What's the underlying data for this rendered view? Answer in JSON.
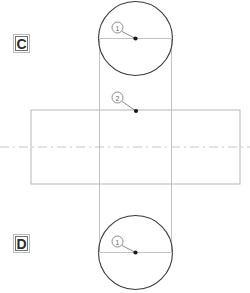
{
  "drawing": {
    "title": "Two-view orthographic part drawing",
    "background_color": "#ffffff",
    "width": 250,
    "height": 293,
    "line_colors": {
      "outline": "#3a3a3a",
      "projection": "#c3c3c3",
      "rectangle": "#b5b5b5",
      "centerline": "#bfc6cf",
      "balloon": "#8a8a8a",
      "leader": "#8a8a8a",
      "marker": "#1a1a1a",
      "tag_border": "#6f6f6f",
      "tag_text": "#2b2b2b"
    },
    "view_tags": [
      {
        "label": "C",
        "x": 13,
        "y": 34
      },
      {
        "label": "D",
        "x": 13,
        "y": 234
      }
    ],
    "circles": [
      {
        "name": "top-view-circle",
        "cx": 135.5,
        "cy": 38.5,
        "r": 37
      },
      {
        "name": "bottom-view-circle",
        "cx": 135.5,
        "cy": 252.5,
        "r": 37
      }
    ],
    "circle_center_lines": [
      {
        "name": "top-circle-horizontal-centerline",
        "x1": 98.5,
        "y1": 38.5,
        "x2": 172.5,
        "y2": 38.5
      },
      {
        "name": "bottom-circle-horizontal-centerline",
        "x1": 98.5,
        "y1": 252.5,
        "x2": 172.5,
        "y2": 252.5
      }
    ],
    "projection_lines": [
      {
        "name": "left-projection-line",
        "x1": 99.5,
        "y1": 38.5,
        "x2": 99.5,
        "y2": 252.5
      },
      {
        "name": "right-projection-line",
        "x1": 171.5,
        "y1": 38.5,
        "x2": 171.5,
        "y2": 252.5
      }
    ],
    "rectangle": {
      "name": "front-view-rectangle",
      "x": 31,
      "y": 110,
      "width": 209,
      "height": 74
    },
    "centerline": {
      "name": "horizontal-axis-centerline",
      "y": 147,
      "x1": 0,
      "x2": 250,
      "dash_pattern": "9 4 2 4"
    },
    "balloons": [
      {
        "id": "balloon-1-top",
        "label": "1",
        "cx": 117.5,
        "cy": 27.5,
        "r": 5.5,
        "leader": {
          "x1": 122,
          "y1": 31.5,
          "x2": 135.5,
          "y2": 38.5
        },
        "marker": {
          "cx": 135.5,
          "cy": 38.5,
          "r": 2.1
        }
      },
      {
        "id": "balloon-2-middle",
        "label": "2",
        "cx": 117.5,
        "cy": 97.5,
        "r": 5.5,
        "leader": {
          "x1": 122.2,
          "y1": 101.5,
          "x2": 136,
          "y2": 111
        },
        "marker": {
          "cx": 136,
          "cy": 111,
          "r": 2.1
        }
      },
      {
        "id": "balloon-1-bottom",
        "label": "1",
        "cx": 117.5,
        "cy": 241.5,
        "r": 5.5,
        "leader": {
          "x1": 122,
          "y1": 245.5,
          "x2": 135.5,
          "y2": 252.5
        },
        "marker": {
          "cx": 135.5,
          "cy": 252.5,
          "r": 2.1
        }
      }
    ]
  }
}
